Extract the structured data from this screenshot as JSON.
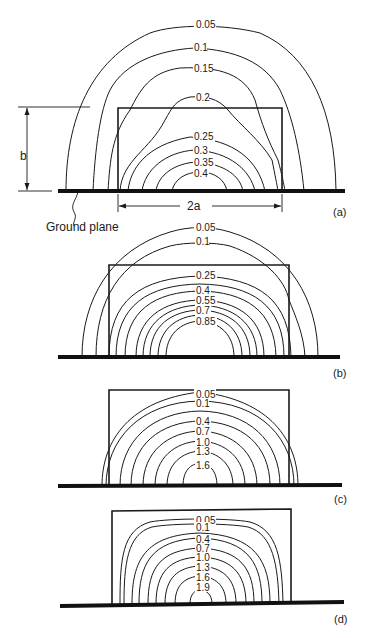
{
  "figure": {
    "panels": [
      {
        "tag": "(a)",
        "dimension_height_label": "b",
        "dimension_width_label": "2a",
        "ground_label": "Ground plane",
        "contour_labels": [
          "0.05",
          "0.1",
          "0.15",
          "0.2",
          "0.25",
          "0.3",
          "0.35",
          "0.4"
        ]
      },
      {
        "tag": "(b)",
        "contour_labels": [
          "0.05",
          "0.1",
          "0.25",
          "0.4",
          "0.55",
          "0.7",
          "0.85"
        ]
      },
      {
        "tag": "(c)",
        "contour_labels": [
          "0.05",
          "0.1",
          "0.4",
          "0.7",
          "1.0",
          "1.3",
          "1.6"
        ]
      },
      {
        "tag": "(d)",
        "contour_labels": [
          "0.05",
          "0.1",
          "0.4",
          "0.7",
          "1.0",
          "1.3",
          "1.6",
          "1.9"
        ]
      }
    ]
  }
}
